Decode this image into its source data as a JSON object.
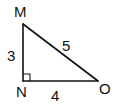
{
  "diagram": {
    "type": "right-triangle",
    "vertices": [
      {
        "id": "M",
        "label": "M",
        "x": 23,
        "y": 24,
        "label_x": 14,
        "label_y": 17
      },
      {
        "id": "N",
        "label": "N",
        "x": 23,
        "y": 81,
        "label_x": 16,
        "label_y": 97
      },
      {
        "id": "O",
        "label": "O",
        "x": 98,
        "y": 81,
        "label_x": 99,
        "label_y": 94
      }
    ],
    "sides": [
      {
        "from": "M",
        "to": "N",
        "length_label": "3",
        "label_x": 7,
        "label_y": 61
      },
      {
        "from": "N",
        "to": "O",
        "length_label": "4",
        "label_x": 51,
        "label_y": 101
      },
      {
        "from": "M",
        "to": "O",
        "length_label": "5",
        "label_x": 62,
        "label_y": 51
      }
    ],
    "right_angle_at": "N",
    "right_angle_marker_size": 7
  }
}
